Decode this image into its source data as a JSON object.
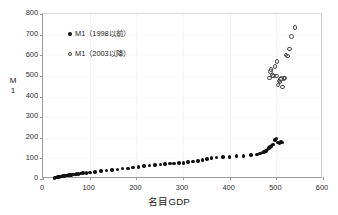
{
  "chart_data": {
    "type": "scatter",
    "title": "",
    "xlabel": "名目GDP",
    "ylabel": "M1",
    "ylabel_chars": [
      "M",
      "1"
    ],
    "xlim": [
      0,
      600
    ],
    "ylim": [
      0,
      800
    ],
    "xticks": [
      0,
      100,
      200,
      300,
      400,
      500,
      600
    ],
    "yticks": [
      0,
      100,
      200,
      300,
      400,
      500,
      600,
      700,
      800
    ],
    "grid": "faint",
    "legend_position": "upper-left-inside",
    "marker_color": "#111111",
    "series": [
      {
        "name": "M1（1998以前）",
        "marker": "filled-circle",
        "points": [
          [
            25,
            5
          ],
          [
            28,
            7
          ],
          [
            31,
            9
          ],
          [
            34,
            10
          ],
          [
            37,
            12
          ],
          [
            40,
            13
          ],
          [
            43,
            14
          ],
          [
            46,
            15
          ],
          [
            49,
            16
          ],
          [
            52,
            17
          ],
          [
            55,
            18
          ],
          [
            58,
            19
          ],
          [
            61,
            20
          ],
          [
            64,
            21
          ],
          [
            68,
            22
          ],
          [
            72,
            24
          ],
          [
            76,
            25
          ],
          [
            80,
            26
          ],
          [
            86,
            28
          ],
          [
            93,
            30
          ],
          [
            101,
            31
          ],
          [
            112,
            35
          ],
          [
            124,
            39
          ],
          [
            136,
            41
          ],
          [
            148,
            44
          ],
          [
            160,
            47
          ],
          [
            170,
            50
          ],
          [
            182,
            51
          ],
          [
            193,
            55
          ],
          [
            205,
            57
          ],
          [
            216,
            62
          ],
          [
            228,
            65
          ],
          [
            240,
            68
          ],
          [
            252,
            70
          ],
          [
            262,
            72
          ],
          [
            272,
            75
          ],
          [
            281,
            76
          ],
          [
            291,
            77
          ],
          [
            301,
            79
          ],
          [
            311,
            82
          ],
          [
            321,
            84
          ],
          [
            332,
            87
          ],
          [
            342,
            93
          ],
          [
            351,
            98
          ],
          [
            361,
            101
          ],
          [
            372,
            104
          ],
          [
            386,
            107
          ],
          [
            400,
            108
          ],
          [
            415,
            111
          ],
          [
            430,
            112
          ],
          [
            446,
            116
          ],
          [
            458,
            118
          ],
          [
            465,
            124
          ],
          [
            470,
            128
          ],
          [
            474,
            132
          ],
          [
            478,
            137
          ],
          [
            481,
            143
          ],
          [
            484,
            149
          ],
          [
            487,
            155
          ],
          [
            490,
            161
          ],
          [
            493,
            168
          ],
          [
            497,
            190
          ],
          [
            500,
            196
          ],
          [
            504,
            176
          ],
          [
            507,
            172
          ],
          [
            510,
            178
          ],
          [
            512,
            177
          ]
        ]
      },
      {
        "name": "M1（2003以降）",
        "marker": "hollow-circle",
        "points": [
          [
            485,
            490
          ],
          [
            487,
            520
          ],
          [
            489,
            530
          ],
          [
            492,
            503
          ],
          [
            494,
            500
          ],
          [
            497,
            545
          ],
          [
            500,
            500
          ],
          [
            501,
            571
          ],
          [
            504,
            455
          ],
          [
            506,
            475
          ],
          [
            508,
            470
          ],
          [
            509,
            485
          ],
          [
            511,
            488
          ],
          [
            513,
            447
          ],
          [
            516,
            487
          ],
          [
            518,
            489
          ],
          [
            521,
            602
          ],
          [
            524,
            597
          ],
          [
            528,
            631
          ],
          [
            532,
            692
          ],
          [
            540,
            735
          ]
        ]
      }
    ]
  },
  "legend": {
    "items": [
      {
        "label": "M1（1998以前）",
        "marker": "filled-circle"
      },
      {
        "label": "M1（2003以降）",
        "marker": "hollow-circle"
      }
    ]
  }
}
